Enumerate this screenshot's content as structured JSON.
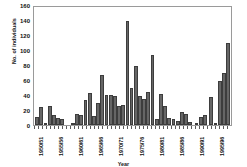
{
  "chart_data": {
    "type": "bar",
    "title": "",
    "xlabel": "Year",
    "ylabel": "No. of individuals",
    "ylim": [
      0,
      160
    ],
    "yticks": [
      0,
      20,
      40,
      60,
      80,
      100,
      120,
      140,
      160
    ],
    "grid": false,
    "legend": null,
    "bar_color": "#666666",
    "bar_edge_color": "#3d3d3d",
    "categories": [
      "1950/51",
      "1951/52",
      "1952/53",
      "1953/54",
      "1954/55",
      "1955/56",
      "1956/57",
      "1957/58",
      "1958/59",
      "1959/60",
      "1960/61",
      "1961/62",
      "1962/63",
      "1963/64",
      "1964/65",
      "1965/66",
      "1966/67",
      "1967/68",
      "1968/69",
      "1969/70",
      "1970/71",
      "1971/72",
      "1972/73",
      "1973/74",
      "1974/75",
      "1975/76",
      "1976/77",
      "1977/78",
      "1978/79",
      "1979/80",
      "1980/81",
      "1981/82",
      "1982/83",
      "1983/84",
      "1984/85",
      "1985/86",
      "1986/87",
      "1987/88",
      "1988/89",
      "1989/90",
      "1990/91",
      "1991/92",
      "1992/93",
      "1993/94",
      "1994/95",
      "1995/96",
      "1996/97",
      "1997/98",
      "1998/99"
    ],
    "values": [
      11,
      24,
      3,
      25,
      14,
      9,
      8,
      0,
      0,
      0,
      2,
      15,
      13,
      33,
      43,
      12,
      29,
      67,
      40,
      40,
      39,
      25,
      27,
      139,
      49,
      79,
      39,
      35,
      44,
      93,
      8,
      41,
      25,
      9,
      8,
      5,
      18,
      15,
      4,
      0,
      1,
      11,
      14,
      0,
      37,
      3,
      59,
      69,
      109
    ],
    "labeled_ticks": [
      {
        "index": 0,
        "label": "1950/51"
      },
      {
        "index": 5,
        "label": "1955/56"
      },
      {
        "index": 10,
        "label": "1960/61"
      },
      {
        "index": 15,
        "label": "1965/66"
      },
      {
        "index": 20,
        "label": "1970/71"
      },
      {
        "index": 25,
        "label": "1975/76"
      },
      {
        "index": 30,
        "label": "1980/81"
      },
      {
        "index": 35,
        "label": "1985/86"
      },
      {
        "index": 40,
        "label": "1990/91"
      },
      {
        "index": 45,
        "label": "1995/96"
      }
    ]
  }
}
